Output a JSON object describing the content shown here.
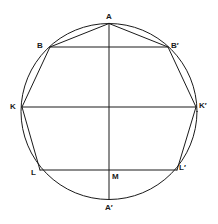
{
  "diagram": {
    "type": "inscribed-polygon-in-circle",
    "stroke_color": "#1a1a1a",
    "background": "#ffffff",
    "circle": {
      "cx": 109,
      "cy": 111.5,
      "r": 88
    },
    "points": {
      "A": {
        "label": "A",
        "x": 109,
        "y": 23.5
      },
      "B": {
        "label": "B",
        "x": 50,
        "y": 47
      },
      "B_prime": {
        "label": "B′",
        "x": 168,
        "y": 47
      },
      "K": {
        "label": "K",
        "x": 22,
        "y": 107
      },
      "K_prime": {
        "label": "K′",
        "x": 196,
        "y": 107
      },
      "L": {
        "label": "L",
        "x": 40,
        "y": 170
      },
      "L_prime": {
        "label": "L′",
        "x": 177,
        "y": 170
      },
      "M": {
        "label": "M",
        "x": 109,
        "y": 170
      },
      "A_prime": {
        "label": "A′",
        "x": 109,
        "y": 199.5
      }
    },
    "segments": [
      [
        "A",
        "B"
      ],
      [
        "B",
        "K"
      ],
      [
        "K",
        "L"
      ],
      [
        "A",
        "B_prime"
      ],
      [
        "B_prime",
        "K_prime"
      ],
      [
        "K_prime",
        "L_prime"
      ],
      [
        "B",
        "B_prime"
      ],
      [
        "K",
        "K_prime"
      ],
      [
        "L",
        "L_prime"
      ],
      [
        "A",
        "A_prime"
      ]
    ]
  }
}
